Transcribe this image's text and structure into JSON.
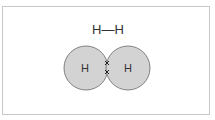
{
  "diagram": {
    "formula": "H—H",
    "atoms": [
      {
        "label": "H",
        "cx": 86,
        "cy": 68,
        "r": 22
      },
      {
        "label": "H",
        "cx": 128,
        "cy": 68,
        "r": 22
      }
    ],
    "shared_electrons": [
      "x",
      "x"
    ],
    "colors": {
      "atom_fill": "#d3d3d3",
      "atom_stroke": "#666666",
      "text": "#333333",
      "frame": "#c8c8c8"
    }
  }
}
